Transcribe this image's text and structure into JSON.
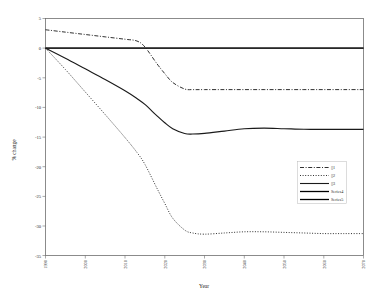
{
  "chart_data": {
    "type": "line",
    "title": "",
    "xlabel": "Year",
    "ylabel": "% change",
    "xlim": [
      1990,
      2070
    ],
    "ylim": [
      -35,
      5
    ],
    "grid": false,
    "legend_position": "bottom-right",
    "x_ticks": [
      "1990",
      "2000",
      "2010",
      "2020",
      "2030",
      "2040",
      "2050",
      "2060",
      "2070"
    ],
    "y_ticks": [
      "5",
      "0",
      "-5",
      "-10",
      "-15",
      "-20",
      "-25",
      "-30",
      "-35"
    ],
    "x": [
      1990,
      1995,
      2000,
      2005,
      2010,
      2013,
      2015,
      2018,
      2020,
      2022,
      2025,
      2027,
      2030,
      2035,
      2040,
      2045,
      2050,
      2055,
      2060,
      2065,
      2070
    ],
    "series": [
      {
        "name": "1",
        "label": "▯1",
        "style": "dash-dot",
        "color": "#1a1a1a",
        "values": [
          3.1,
          2.7,
          2.3,
          1.9,
          1.5,
          1.2,
          0.2,
          -2.6,
          -4.3,
          -5.8,
          -6.9,
          -7.0,
          -7.0,
          -7.0,
          -7.0,
          -7.0,
          -7.0,
          -7.0,
          -7.0,
          -7.0,
          -7.0
        ]
      },
      {
        "name": "2",
        "label": "▯2",
        "style": "dotted",
        "color": "#1a1a1a",
        "values": [
          0.0,
          -3.6,
          -7.4,
          -11.2,
          -15.1,
          -17.6,
          -19.6,
          -23.6,
          -26.2,
          -28.7,
          -30.7,
          -31.2,
          -31.4,
          -31.2,
          -31.0,
          -31.0,
          -31.1,
          -31.2,
          -31.3,
          -31.3,
          -31.3
        ]
      },
      {
        "name": "3",
        "label": "▯3",
        "style": "solid",
        "color": "#1a1a1a",
        "values": [
          0.0,
          -1.7,
          -3.5,
          -5.3,
          -7.2,
          -8.5,
          -9.5,
          -11.4,
          -12.6,
          -13.6,
          -14.4,
          -14.5,
          -14.4,
          -14.0,
          -13.6,
          -13.5,
          -13.6,
          -13.7,
          -13.7,
          -13.7,
          -13.7
        ]
      },
      {
        "name": "Series4",
        "label": "Series4",
        "style": "solid",
        "color": "#000000",
        "values": [
          0,
          0,
          0,
          0,
          0,
          0,
          0,
          0,
          0,
          0,
          0,
          0,
          0,
          0,
          0,
          0,
          0,
          0,
          0,
          0,
          0
        ]
      },
      {
        "name": "Series5",
        "label": "Series5",
        "style": "solid",
        "color": "#000000",
        "values": [
          0,
          0,
          0,
          0,
          0,
          0,
          0,
          0,
          0,
          0,
          0,
          0,
          0,
          0,
          0,
          0,
          0,
          0,
          0,
          0,
          0
        ]
      }
    ]
  }
}
